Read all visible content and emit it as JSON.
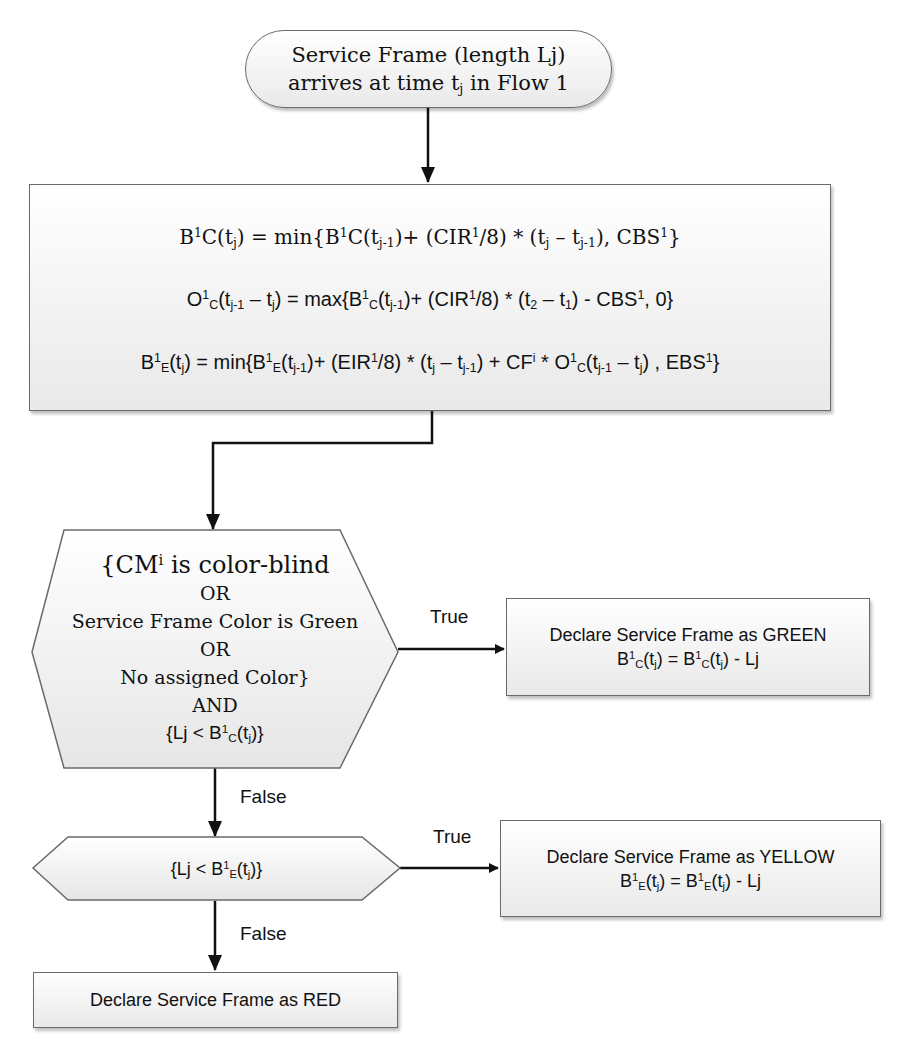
{
  "diagram": {
    "type": "flowchart",
    "start": {
      "line1": "Service Frame (length Lj)",
      "line2_prefix": "arrives at time t",
      "line2_sub": "j",
      "line2_suffix": " in Flow 1"
    },
    "formulas": [
      "B¹C(tj) = min{B¹C(tj-1)+ (CIR¹/8) * (tj – tj-1), CBS¹}",
      "O¹C(tj-1 – tj) = max{B¹C(tj-1)+ (CIR¹/8) * (t2 – t1) - CBS¹, 0}",
      "B¹E(tj) = min{B¹E(tj-1)+ (EIR¹/8) * (tj – tj-1) + CFⁱ * O¹C(tj-1 – tj) , EBS¹}"
    ],
    "decision1": {
      "lines": [
        "{CMⁱ is color-blind",
        "OR",
        "Service Frame Color is Green",
        "OR",
        "No assigned Color}",
        "AND",
        "{Lj < B¹C(tj)}"
      ]
    },
    "decision2": {
      "text": "{Lj < B¹E(tj)}"
    },
    "green_box": {
      "title": "Declare Service Frame as GREEN",
      "formula": "B¹C(tj) = B¹C(tj) - Lj"
    },
    "yellow_box": {
      "title": "Declare Service Frame as YELLOW",
      "formula": "B¹E(tj) = B¹E(tj) - Lj"
    },
    "red_box": {
      "title": "Declare Service Frame as RED"
    },
    "edge_labels": {
      "true1": "True",
      "false1": "False",
      "true2": "True",
      "false2": "False"
    }
  }
}
